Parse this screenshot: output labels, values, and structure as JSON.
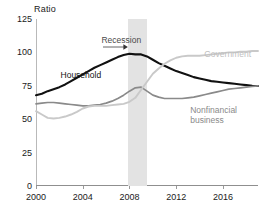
{
  "chart_data": {
    "type": "line",
    "title": "",
    "subtitle": "",
    "ylabel": "Ratio",
    "xlabel": "",
    "ylim": [
      0,
      125
    ],
    "xlim": [
      2000,
      2019
    ],
    "yticks": [
      0,
      25,
      50,
      75,
      100,
      125
    ],
    "xticks": [
      2000,
      2004,
      2008,
      2012,
      2016
    ],
    "ytick_labels": [
      "0",
      "25",
      "50",
      "75",
      "100",
      "125"
    ],
    "xtick_labels": [
      "2000",
      "2004",
      "2008",
      "2012",
      "2016"
    ],
    "grid": false,
    "legend": "inline-annotations",
    "annotations": [
      {
        "name": "recession-annotation",
        "text": "Recession",
        "x": 2005.6,
        "y": 112,
        "arrow_to_x": 2007.9
      },
      {
        "name": "household-annotation",
        "text": "Household",
        "x": 2002.1,
        "y": 86,
        "color": "#111111"
      },
      {
        "name": "government-annotation",
        "text": "Government",
        "x": 2014.4,
        "y": 102,
        "color": "#bfbfbf"
      },
      {
        "name": "nonfinancial-annotation",
        "text": "Nonfinancial business",
        "x": 2013.2,
        "y": 60,
        "color": "#8a8a8a"
      }
    ],
    "shaded_regions": [
      {
        "name": "recession-band",
        "x_start": 2007.9,
        "x_end": 2009.5,
        "color": "#e3e3e3",
        "label": "Recession"
      }
    ],
    "x": [
      2000,
      2000.5,
      2001,
      2001.5,
      2002,
      2002.5,
      2003,
      2003.5,
      2004,
      2004.5,
      2005,
      2005.5,
      2006,
      2006.5,
      2007,
      2007.5,
      2008,
      2008.5,
      2009,
      2009.5,
      2010,
      2010.5,
      2011,
      2011.5,
      2012,
      2012.5,
      2013,
      2013.5,
      2014,
      2014.5,
      2015,
      2015.5,
      2016,
      2016.5,
      2017,
      2017.5,
      2018,
      2018.5,
      2019
    ],
    "series": [
      {
        "name": "Household",
        "color": "#111111",
        "width": 2.1,
        "values": [
          68,
          69,
          71,
          72.5,
          74,
          76,
          78.5,
          81,
          83.5,
          86,
          88.5,
          90.5,
          92.5,
          94.5,
          96.5,
          98,
          99,
          98.5,
          98.5,
          97,
          94.5,
          92,
          90,
          88,
          86,
          84.5,
          83,
          81.5,
          80.5,
          79.5,
          78.5,
          78,
          77.5,
          77,
          76.5,
          76,
          75.5,
          75,
          74.8
        ]
      },
      {
        "name": "Nonfinancial business",
        "color": "#8a8a8a",
        "width": 1.7,
        "values": [
          61.5,
          62,
          62.5,
          62.5,
          62,
          61.5,
          61,
          60.5,
          60,
          60,
          60.5,
          61,
          62,
          63.5,
          65.5,
          68,
          71,
          73.5,
          74,
          71,
          68,
          66.5,
          65.5,
          65.5,
          65.5,
          65.5,
          66,
          66.5,
          67.5,
          68.5,
          69.5,
          70.5,
          71.5,
          72.5,
          73,
          73.5,
          74,
          74.5,
          75
        ]
      },
      {
        "name": "Government",
        "color": "#c9c9c9",
        "width": 1.9,
        "values": [
          56,
          53.5,
          51,
          50.5,
          51,
          52,
          53.5,
          55.5,
          58,
          59.5,
          60,
          60,
          60,
          60.5,
          61,
          61.5,
          63,
          66,
          72,
          78,
          84,
          88,
          91.5,
          94,
          96,
          97,
          97.5,
          97.5,
          97.5,
          98,
          98.5,
          99,
          99.5,
          100,
          100,
          100.5,
          100.5,
          101,
          101
        ]
      }
    ]
  },
  "footnote": {
    "text": ""
  }
}
